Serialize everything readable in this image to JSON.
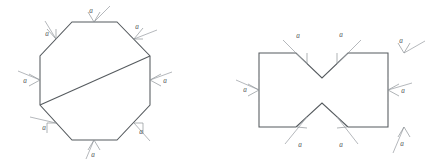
{
  "document": {
    "title": "Polygon side dimension diagrams",
    "background_color": "#ffffff",
    "stroke_color": "#555a5e",
    "leader_color": "#8d9297",
    "label_color": "#4a4f53",
    "figure_count": 2
  },
  "figures": [
    {
      "id": "octagon-figure",
      "name": "regular-octagon-with-diagonal",
      "shape": "octagon",
      "description": "Regular octagon with a diagonal chord drawn from the lower-left vertex to the upper-right vertex",
      "side_count": 8,
      "label_count": 8,
      "vertices": [
        [
          72,
          22
        ],
        [
          117,
          22
        ],
        [
          150,
          56
        ],
        [
          150,
          105
        ],
        [
          117,
          140
        ],
        [
          72,
          140
        ],
        [
          40,
          105
        ],
        [
          40,
          56
        ]
      ],
      "chord": {
        "name": "octagon-diagonal",
        "from": [
          40,
          105
        ],
        "to": [
          150,
          56
        ]
      },
      "labels": [
        {
          "text": "a",
          "name": "side-label-top",
          "side": "top",
          "text_pos": [
            91,
            13
          ],
          "arrow_tip": [
            94,
            22
          ],
          "arrow_dir": "down",
          "leader_from": [
            94,
            22
          ],
          "leader_to": [
            110,
            6
          ]
        },
        {
          "text": "a",
          "name": "side-label-top-right",
          "side": "top-right",
          "text_pos": [
            137,
            27
          ],
          "arrow_tip": [
            134,
            39
          ],
          "arrow_dir": "down-left",
          "leader_from": [
            134,
            39
          ],
          "leader_to": [
            157,
            30
          ]
        },
        {
          "text": "a",
          "name": "side-label-right",
          "side": "right",
          "text_pos": [
            163,
            83
          ],
          "arrow_tip": [
            150,
            80
          ],
          "arrow_dir": "left",
          "leader_from": [
            150,
            80
          ],
          "leader_to": [
            172,
            72
          ]
        },
        {
          "text": "a",
          "name": "side-label-bottom-right",
          "side": "bottom-right",
          "text_pos": [
            140,
            131
          ],
          "arrow_tip": [
            134,
            123
          ],
          "arrow_dir": "up-left",
          "leader_from": [
            134,
            123
          ],
          "leader_to": [
            150,
            140
          ]
        },
        {
          "text": "a",
          "name": "side-label-bottom",
          "side": "bottom",
          "text_pos": [
            91,
            151
          ],
          "arrow_tip": [
            94,
            140
          ],
          "arrow_dir": "up",
          "leader_from": [
            94,
            140
          ],
          "leader_to": [
            86,
            158
          ]
        },
        {
          "text": "a",
          "name": "side-label-bottom-left",
          "side": "bottom-left",
          "text_pos": [
            44,
            128
          ],
          "arrow_tip": [
            56,
            123
          ],
          "arrow_dir": "up-right",
          "leader_from": [
            56,
            123
          ],
          "leader_to": [
            30,
            117
          ]
        },
        {
          "text": "a",
          "name": "side-label-left",
          "side": "left",
          "text_pos": [
            26,
            83
          ],
          "arrow_tip": [
            40,
            80
          ],
          "arrow_dir": "right",
          "leader_from": [
            40,
            80
          ],
          "leader_to": [
            18,
            71
          ]
        },
        {
          "text": "a",
          "name": "side-label-top-left",
          "side": "top-left",
          "text_pos": [
            47,
            35
          ],
          "arrow_tip": [
            56,
            39
          ],
          "arrow_dir": "down-right",
          "leader_from": [
            56,
            39
          ],
          "leader_to": [
            45,
            22
          ]
        }
      ]
    },
    {
      "id": "notched-rectangle-figure",
      "name": "rectangle-with-v-notches",
      "shape": "hexagonal-notched-rectangle",
      "description": "Rectangle with a V-shaped notch cut into the top edge and a matching V notch cut into the bottom edge, forming a bowtie profile",
      "side_count": 8,
      "label_count": 7,
      "vertices": [
        [
          259,
          53
        ],
        [
          296,
          53
        ],
        [
          322,
          78
        ],
        [
          348,
          53
        ],
        [
          388,
          53
        ],
        [
          388,
          127
        ],
        [
          348,
          127
        ],
        [
          322,
          103
        ],
        [
          296,
          127
        ],
        [
          259,
          127
        ]
      ],
      "notches": [
        {
          "name": "top-v-notch",
          "apex": [
            322,
            78
          ],
          "left_opening": [
            296,
            53
          ],
          "right_opening": [
            348,
            53
          ]
        },
        {
          "name": "bottom-v-notch",
          "apex": [
            322,
            103
          ],
          "left_opening": [
            296,
            127
          ],
          "right_opening": [
            348,
            127
          ]
        }
      ],
      "labels": [
        {
          "text": "a",
          "name": "side-label-notch-top-left",
          "side": "top-notch-left",
          "text_pos": [
            297,
            36
          ],
          "arrow_tip": [
            307,
            64
          ],
          "arrow_dir": "down-right",
          "leader_from": [
            307,
            64
          ],
          "leader_to": [
            283,
            40
          ]
        },
        {
          "text": "a",
          "name": "side-label-notch-top-right",
          "side": "top-notch-right",
          "text_pos": [
            340,
            35
          ],
          "arrow_tip": [
            337,
            64
          ],
          "arrow_dir": "down-left",
          "leader_from": [
            337,
            64
          ],
          "leader_to": [
            360,
            40
          ]
        },
        {
          "text": "a",
          "name": "side-label-top-right-edge",
          "side": "top-right",
          "text_pos": [
            401,
            42
          ],
          "arrow_tip": [
            404,
            53
          ],
          "arrow_dir": "down",
          "leader_from": [
            404,
            53
          ],
          "leader_to": [
            418,
            41
          ]
        },
        {
          "text": "a",
          "name": "side-label-right-edge",
          "side": "right",
          "text_pos": [
            402,
            93
          ],
          "arrow_tip": [
            388,
            90
          ],
          "arrow_dir": "left",
          "leader_from": [
            388,
            90
          ],
          "leader_to": [
            412,
            83
          ]
        },
        {
          "text": "a",
          "name": "side-label-bottom-right-edge",
          "side": "bottom-right",
          "text_pos": [
            401,
            145
          ],
          "arrow_tip": [
            404,
            127
          ],
          "arrow_dir": "up",
          "leader_from": [
            404,
            127
          ],
          "leader_to": [
            394,
            152
          ]
        },
        {
          "text": "a",
          "name": "side-label-notch-bottom-right",
          "side": "bottom-notch-right",
          "text_pos": [
            340,
            148
          ],
          "arrow_tip": [
            337,
            117
          ],
          "arrow_dir": "up-left",
          "leader_from": [
            337,
            117
          ],
          "leader_to": [
            357,
            143
          ]
        },
        {
          "text": "a",
          "name": "side-label-notch-bottom-left",
          "side": "bottom-notch-left",
          "text_pos": [
            299,
            148
          ],
          "arrow_tip": [
            307,
            117
          ],
          "arrow_dir": "up-right",
          "leader_from": [
            307,
            117
          ],
          "leader_to": [
            285,
            143
          ]
        },
        {
          "text": "a",
          "name": "side-label-left-edge",
          "side": "left",
          "text_pos": [
            246,
            92
          ],
          "arrow_tip": [
            259,
            90
          ],
          "arrow_dir": "right",
          "leader_from": [
            259,
            90
          ],
          "leader_to": [
            236,
            80
          ]
        }
      ]
    }
  ]
}
